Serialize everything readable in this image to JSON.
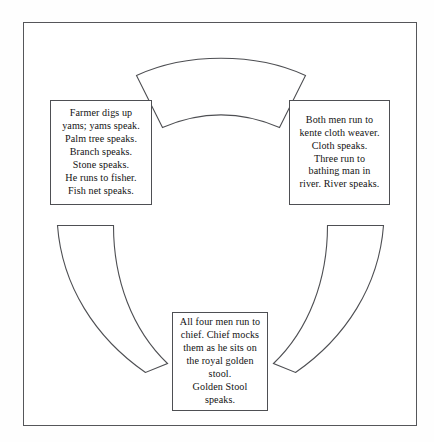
{
  "diagram": {
    "type": "cycle-diagram",
    "title": "",
    "frame": {
      "name": "outer-border"
    },
    "boxes": [
      {
        "id": "left",
        "position": "left",
        "text": "Farmer digs up\nyams; yams speak.\nPalm tree speaks.\nBranch speaks.\nStone speaks.\nHe runs to fisher.\nFish net speaks."
      },
      {
        "id": "right",
        "position": "right",
        "text": "Both men run to\nkente cloth weaver.\nCloth speaks.\nThree run to\nbathing man in\nriver. River speaks."
      },
      {
        "id": "bottom",
        "position": "bottom",
        "text": "All four men run to\nchief.  Chief mocks\nthem as he sits on\nthe royal golden\nstool.\nGolden Stool\nspeaks."
      }
    ],
    "arcs": [
      {
        "id": "top",
        "name": "arc-segment-top"
      },
      {
        "id": "bottom-left",
        "name": "arc-segment-bottom-left"
      },
      {
        "id": "bottom-right",
        "name": "arc-segment-bottom-right"
      }
    ],
    "colors": {
      "stroke": "#4e4f53",
      "background": "#ffffff",
      "text": "#121212"
    }
  }
}
